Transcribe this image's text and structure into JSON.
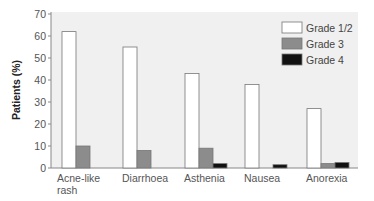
{
  "chart_data": {
    "type": "bar",
    "title": "",
    "xlabel": "",
    "ylabel": "Patients (%)",
    "ylim": [
      0,
      70
    ],
    "yticks": [
      0,
      10,
      20,
      30,
      40,
      50,
      60,
      70
    ],
    "grid": false,
    "legend_position": "upper right",
    "categories": [
      "Acne-like rash",
      "Diarrhoea",
      "Asthenia",
      "Nausea",
      "Anorexia"
    ],
    "category_lines": [
      [
        "Acne-like",
        "rash"
      ],
      [
        "Diarrhoea"
      ],
      [
        "Asthenia"
      ],
      [
        "Nausea"
      ],
      [
        "Anorexia"
      ]
    ],
    "series": [
      {
        "name": "Grade 1/2",
        "color": "#ffffff",
        "values": [
          62,
          55,
          43,
          38,
          27
        ]
      },
      {
        "name": "Grade 3",
        "color": "#8c8c8c",
        "values": [
          10,
          8,
          9,
          0,
          2
        ]
      },
      {
        "name": "Grade 4",
        "color": "#111111",
        "values": [
          0,
          0,
          2,
          1.5,
          2.5
        ]
      }
    ]
  },
  "colors": {
    "plot_background": "#f0f0f0",
    "axis": "#888888",
    "bar_outline": "#777777"
  }
}
